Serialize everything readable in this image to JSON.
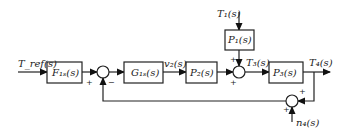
{
  "diagram": {
    "type": "control-block-diagram",
    "signals": {
      "input": "T_ref(s)",
      "v2": "v₂(s)",
      "t1": "T₁(s)",
      "t3": "T₃(s)",
      "t4": "T₄(s)",
      "n4": "n₄(s)"
    },
    "blocks": [
      {
        "id": "F1s",
        "label": "F₁ₛ(s)"
      },
      {
        "id": "G1s",
        "label": "G₁ₛ(s)"
      },
      {
        "id": "P2",
        "label": "P₂(s)"
      },
      {
        "id": "P1",
        "label": "P₁(s)"
      },
      {
        "id": "P3",
        "label": "P₃(s)"
      }
    ],
    "summing_junctions": [
      {
        "id": "sum1",
        "signs": [
          "+",
          "−"
        ]
      },
      {
        "id": "sum2",
        "signs": [
          "+",
          "+"
        ]
      },
      {
        "id": "sum3",
        "signs": [
          "+",
          "+"
        ]
      }
    ]
  }
}
